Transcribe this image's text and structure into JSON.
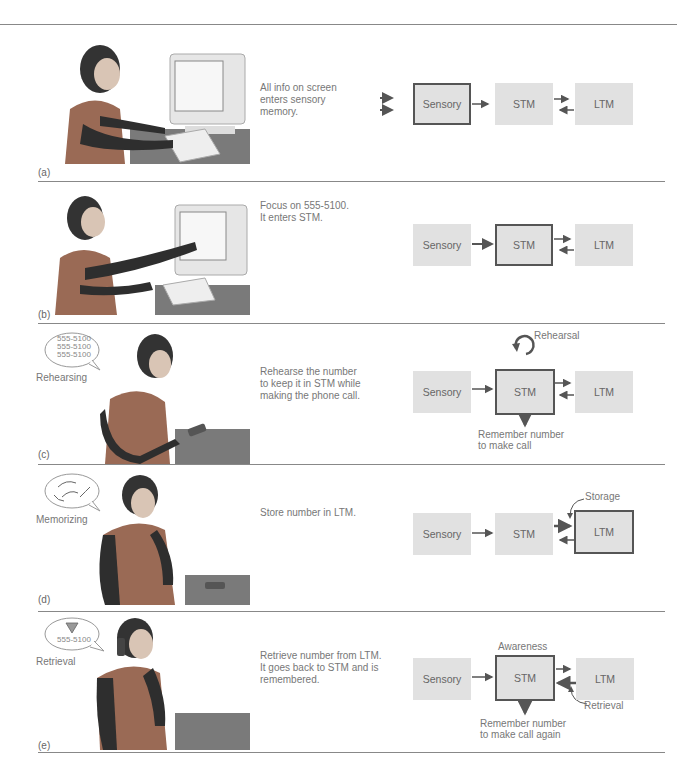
{
  "figure": {
    "panels": [
      {
        "letter": "(a)",
        "description": [
          "All info on screen",
          "enters sensory",
          "memory."
        ],
        "illustration": "woman-at-computer",
        "boxes": {
          "sensory": "Sensory",
          "stm": "STM",
          "ltm": "LTM"
        },
        "highlighted": "sensory"
      },
      {
        "letter": "(b)",
        "description": [
          "Focus on 555-5100.",
          "It enters STM."
        ],
        "illustration": "woman-pointing-at-screen",
        "boxes": {
          "sensory": "Sensory",
          "stm": "STM",
          "ltm": "LTM"
        },
        "highlighted": "stm"
      },
      {
        "letter": "(c)",
        "description": [
          "Rehearse the number",
          "to keep it in STM while",
          "making the phone call."
        ],
        "illustration": "woman-dialing-phone",
        "side_label": "Rehearsing",
        "bubble": [
          "555-5100",
          "555-5100",
          "555-5100"
        ],
        "boxes": {
          "sensory": "Sensory",
          "stm": "STM",
          "ltm": "LTM"
        },
        "highlighted": "stm",
        "annotations": {
          "loop": "Rehearsal",
          "output": [
            "Remember number",
            "to make call"
          ]
        }
      },
      {
        "letter": "(d)",
        "description": [
          "Store number in LTM."
        ],
        "illustration": "woman-thinking",
        "side_label": "Memorizing",
        "boxes": {
          "sensory": "Sensory",
          "stm": "STM",
          "ltm": "LTM"
        },
        "highlighted": "ltm",
        "annotations": {
          "storage": "Storage"
        }
      },
      {
        "letter": "(e)",
        "description": [
          "Retrieve number from LTM.",
          "It goes back to STM and is",
          "remembered."
        ],
        "illustration": "woman-on-phone",
        "side_label": "Retrieval",
        "bubble": [
          "555-5100"
        ],
        "boxes": {
          "sensory": "Sensory",
          "stm": "STM",
          "ltm": "LTM"
        },
        "highlighted": "stm",
        "annotations": {
          "top": "Awareness",
          "retrieval": "Retrieval",
          "output": [
            "Remember number",
            "to make call again"
          ]
        }
      }
    ]
  }
}
